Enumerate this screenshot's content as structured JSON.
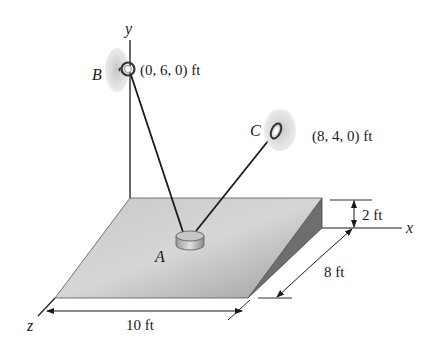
{
  "figure": {
    "axes": {
      "x": "x",
      "y": "y",
      "z": "z"
    },
    "points": {
      "A": {
        "label": "A"
      },
      "B": {
        "label": "B",
        "coords": "(0, 6, 0) ft"
      },
      "C": {
        "label": "C",
        "coords": "(8, 4, 0) ft"
      }
    },
    "dimensions": {
      "height": "2 ft",
      "depth": "8 ft",
      "width": "10 ft"
    },
    "colors": {
      "plate_top": "#b9b9b9",
      "plate_side": "#6e6e6e",
      "ring_halo": "#cfcfcf",
      "line": "#1a1a1a"
    }
  }
}
